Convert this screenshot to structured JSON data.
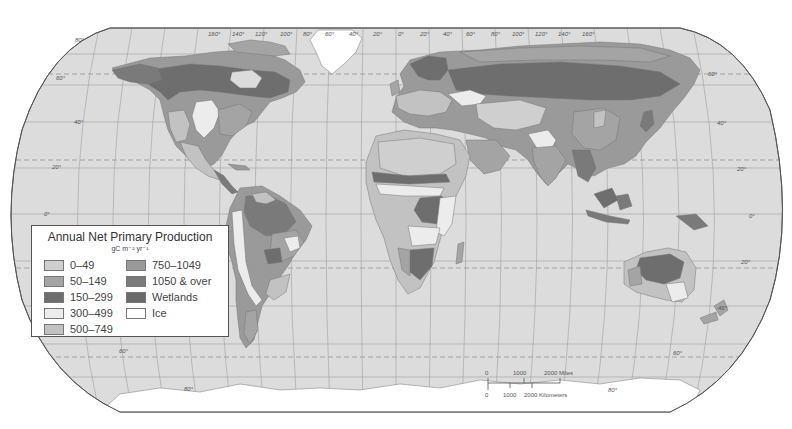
{
  "map": {
    "projection": "Robinson",
    "colors": {
      "ocean": "#dcdcdc",
      "graticule": "#9a9a9a",
      "outline": "#666666",
      "tropic_dash": "#8a8a8a"
    },
    "longitude_labels": [
      "160°",
      "140°",
      "120°",
      "100°",
      "80°",
      "60°",
      "40°",
      "20°",
      "0°",
      "20°",
      "40°",
      "60°",
      "80°",
      "100°",
      "120°",
      "140°",
      "160°"
    ],
    "latitude_labels_left": [
      "80°",
      "60°",
      "40°",
      "20°",
      "0°",
      "20°",
      "40°",
      "60°",
      "80°"
    ],
    "latitude_labels_right": [
      "80°",
      "60°",
      "40°",
      "20°",
      "0°",
      "20°",
      "40°",
      "60°",
      "80°"
    ]
  },
  "legend": {
    "title": "Annual Net Primary Production",
    "unit": "gC m⁻² yr⁻¹",
    "items": [
      {
        "label": "0–49",
        "color": "#cfcfcf"
      },
      {
        "label": "50–149",
        "color": "#a4a4a4"
      },
      {
        "label": "150–299",
        "color": "#6e6e6e"
      },
      {
        "label": "300–499",
        "color": "#ececec"
      },
      {
        "label": "500–749",
        "color": "#c2c2c2"
      },
      {
        "label": "750–1049",
        "color": "#9a9a9a"
      },
      {
        "label": "1050 & over",
        "color": "#7a7a7a"
      },
      {
        "label": "Wetlands",
        "color": "#6a6a6a"
      },
      {
        "label": "Ice",
        "color": "#ffffff"
      }
    ]
  },
  "scale_bar": {
    "miles_labels": [
      "0",
      "1000",
      "2000 Miles"
    ],
    "km_labels": [
      "0",
      "1000",
      "2000 Kilometers"
    ]
  }
}
